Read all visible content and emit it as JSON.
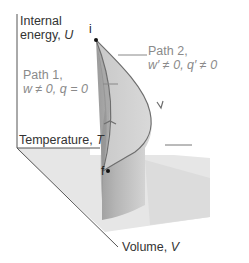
{
  "axes": {
    "internal_energy": {
      "line1": "Internal",
      "line2": "energy,",
      "symbol": "U"
    },
    "temperature": {
      "label": "Temperature,",
      "symbol": "T"
    },
    "volume": {
      "label": "Volume,",
      "symbol": "V"
    }
  },
  "points": {
    "initial": "i",
    "final": "f"
  },
  "paths": [
    {
      "name": "Path 1,",
      "condition": "w ≠ 0,  q = 0"
    },
    {
      "name": "Path 2,",
      "condition": "w′ ≠ 0,  q′ ≠ 0"
    }
  ],
  "colors": {
    "floor": "#e4e4e4",
    "surface_light": "#d4d4d4",
    "surface_mid": "#bdbdbd",
    "surface_dark": "#9a9a9a",
    "curve": "#6e6e6e",
    "axis": "#555555",
    "path_text": "#8a8a8a"
  }
}
